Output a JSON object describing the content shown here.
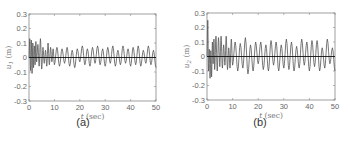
{
  "chart_data": [
    {
      "type": "line",
      "panel": "(a)",
      "title": "",
      "xlabel": "t (sec)",
      "ylabel": "u1 (m)",
      "xlim": [
        0,
        50
      ],
      "ylim": [
        -0.3,
        0.3
      ],
      "xticks": [
        0,
        10,
        20,
        30,
        40,
        50
      ],
      "yticks": [
        -0.3,
        -0.2,
        -0.1,
        0,
        0.1,
        0.2,
        0.3
      ],
      "grid": false,
      "description": "Damped-then-steady oscillation around zero; initial transient up to about ±0.13, then sustained oscillation with amplitude roughly ±0.05 to ±0.08 over 0–50 s, with a flat black zero line.",
      "series": [
        {
          "name": "u1",
          "x": [
            0,
            0.3,
            0.6,
            0.9,
            1.2,
            1.5,
            1.8,
            2.1,
            2.4,
            2.7,
            3.0,
            3.5,
            4.0,
            4.5,
            5.0,
            5.5,
            6.0,
            6.5,
            7.0,
            7.5,
            8.0,
            8.5,
            9.0,
            9.5,
            10,
            11,
            12,
            13,
            14,
            15,
            16,
            17,
            18,
            19,
            20,
            21,
            22,
            23,
            24,
            25,
            26,
            27,
            28,
            29,
            30,
            31,
            32,
            33,
            34,
            35,
            36,
            37,
            38,
            39,
            40,
            41,
            42,
            43,
            44,
            45,
            46,
            47,
            48,
            49,
            50
          ],
          "values": [
            0.0,
            0.13,
            -0.09,
            0.12,
            -0.11,
            0.1,
            -0.07,
            0.08,
            -0.05,
            0.11,
            -0.03,
            0.09,
            -0.06,
            0.13,
            -0.08,
            0.07,
            -0.04,
            0.05,
            -0.06,
            0.1,
            -0.05,
            0.07,
            -0.03,
            0.06,
            -0.05,
            0.07,
            -0.06,
            0.06,
            -0.04,
            0.07,
            -0.06,
            0.05,
            -0.07,
            0.06,
            -0.03,
            0.08,
            -0.05,
            0.06,
            -0.06,
            0.07,
            -0.04,
            0.08,
            -0.05,
            0.06,
            -0.06,
            0.07,
            -0.04,
            0.08,
            -0.06,
            0.05,
            -0.05,
            0.08,
            -0.04,
            0.06,
            -0.06,
            0.07,
            -0.05,
            0.08,
            -0.06,
            0.05,
            -0.04,
            0.08,
            -0.05,
            0.05,
            -0.07
          ]
        },
        {
          "name": "zero",
          "x": [
            0,
            50
          ],
          "values": [
            0,
            0
          ]
        }
      ]
    },
    {
      "type": "line",
      "panel": "(b)",
      "title": "",
      "xlabel": "t (sec)",
      "ylabel": "u2 (m)",
      "xlim": [
        0,
        50
      ],
      "ylim": [
        -0.3,
        0.3
      ],
      "xticks": [
        0,
        10,
        20,
        30,
        40,
        50
      ],
      "yticks": [
        -0.3,
        -0.2,
        -0.1,
        0,
        0.1,
        0.2,
        0.3
      ],
      "grid": false,
      "description": "Initial spike to about 0.25 and dip to about -0.15, then sustained oscillation around zero with amplitude roughly ±0.1 to ±0.14 over 0–50 s, with a flat black zero line.",
      "series": [
        {
          "name": "u2",
          "x": [
            0,
            0.3,
            0.6,
            0.9,
            1.2,
            1.5,
            1.8,
            2.1,
            2.4,
            2.7,
            3.0,
            3.5,
            4.0,
            4.5,
            5.0,
            5.5,
            6.0,
            6.5,
            7.0,
            7.5,
            8.0,
            8.5,
            9.0,
            9.5,
            10,
            11,
            12,
            13,
            14,
            15,
            16,
            17,
            18,
            19,
            20,
            21,
            22,
            23,
            24,
            25,
            26,
            27,
            28,
            29,
            30,
            31,
            32,
            33,
            34,
            35,
            36,
            37,
            38,
            39,
            40,
            41,
            42,
            43,
            44,
            45,
            46,
            47,
            48,
            49,
            50
          ],
          "values": [
            0.0,
            0.25,
            -0.1,
            0.05,
            -0.15,
            0.04,
            -0.14,
            0.1,
            -0.05,
            0.12,
            -0.09,
            0.14,
            -0.1,
            0.13,
            -0.07,
            0.14,
            -0.08,
            0.08,
            -0.06,
            0.14,
            -0.09,
            0.06,
            -0.08,
            0.12,
            -0.06,
            0.1,
            -0.1,
            0.09,
            -0.08,
            0.13,
            -0.12,
            0.08,
            -0.1,
            0.1,
            -0.05,
            0.1,
            -0.09,
            0.08,
            -0.1,
            0.11,
            -0.06,
            0.1,
            -0.1,
            0.08,
            -0.08,
            0.12,
            -0.09,
            0.1,
            -0.1,
            0.07,
            -0.08,
            0.12,
            -0.06,
            0.1,
            -0.1,
            0.11,
            -0.07,
            0.11,
            -0.1,
            0.06,
            -0.08,
            0.12,
            -0.05,
            0.06,
            -0.1
          ]
        },
        {
          "name": "zero",
          "x": [
            0,
            50
          ],
          "values": [
            0,
            0
          ]
        }
      ]
    }
  ],
  "panels": {
    "a": {
      "caption": "(a)",
      "ylabel_main": "u",
      "ylabel_sub": "1",
      "ylabel_unit": " (m)",
      "xlabel_var": "t",
      "xlabel_unit": " (sec)"
    },
    "b": {
      "caption": "(b)",
      "ylabel_main": "u",
      "ylabel_sub": "2",
      "ylabel_unit": " (m)",
      "xlabel_var": "t",
      "xlabel_unit": " (sec)"
    }
  },
  "colors": {
    "signal": "#555555",
    "zero_line": "#111111",
    "axes": "#888888",
    "tick_text": "#666666"
  }
}
